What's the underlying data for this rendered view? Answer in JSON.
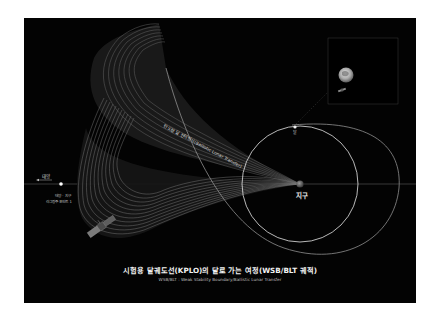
{
  "title": "시험용 달궤도선(KPLO)의 달로 가는 여정(WSB/BLT 궤적)",
  "subtitle": "WSB/BLT : Weak Stability Boundary/Ballistic Lunar Transfer",
  "labels": {
    "sun": "태양",
    "l1_line1": "태양 · 지구",
    "l1_line2": "라그랑주 포인트 1",
    "earth": "지구",
    "moon": "달",
    "trajectory": "탄도형 달 전이방식(Ballistic Lunar Transfer)"
  },
  "colors": {
    "background": "#030303",
    "page": "#ffffff",
    "orbit": "#e6e6e6",
    "trajectory_fan": "#8a8a8a"
  },
  "icons": {
    "spacecraft": "satellite-icon",
    "moon_inset": "moon-icon",
    "earth": "earth-icon",
    "l1_point": "lagrange-point-icon",
    "sun_arrow": "arrow-left-icon"
  }
}
